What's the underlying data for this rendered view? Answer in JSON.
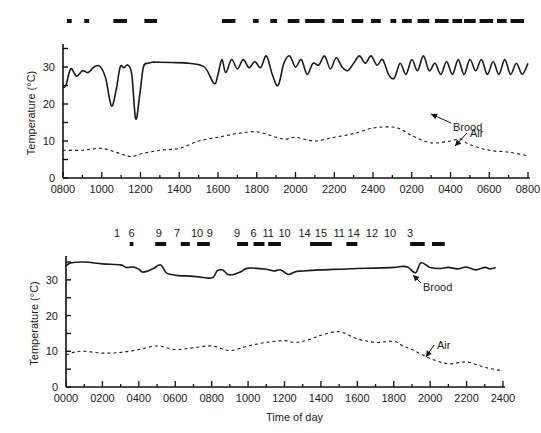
{
  "chart_data": [
    {
      "type": "line",
      "panel": "top",
      "title": "",
      "xlabel": "",
      "ylabel": "Temperature (°C)",
      "ylim": [
        0,
        36
      ],
      "yticks_labeled": [
        0,
        10,
        20,
        30
      ],
      "yticks_minor": [
        5,
        15,
        25,
        35
      ],
      "x_unit": "hours since 0800",
      "xlim": [
        0,
        24
      ],
      "xtick_labels": [
        "0800",
        "1000",
        "1200",
        "1400",
        "1600",
        "1800",
        "2000",
        "2200",
        "2400",
        "0200",
        "0400",
        "0600",
        "0800"
      ],
      "xtick_labels_at_hours": [
        0,
        2,
        4,
        6,
        8,
        10,
        12,
        14,
        16,
        18,
        20,
        22,
        24
      ],
      "grid": false,
      "legend": "none",
      "series": [
        {
          "name": "Brood",
          "style": "solid",
          "x": [
            0,
            0.15,
            0.4,
            0.7,
            1.0,
            1.3,
            1.6,
            1.9,
            2.2,
            2.5,
            2.75,
            2.95,
            3.15,
            3.35,
            3.55,
            3.75,
            3.95,
            4.15,
            4.4,
            4.6,
            4.8,
            5.0,
            5.6,
            6.5,
            7.3,
            7.8,
            8.0,
            8.2,
            8.4,
            8.7,
            9.0,
            9.3,
            9.6,
            9.9,
            10.2,
            10.5,
            10.8,
            11.1,
            11.4,
            11.7,
            12.0,
            12.3,
            12.6,
            12.9,
            13.2,
            13.5,
            13.8,
            14.1,
            14.4,
            14.7,
            15.0,
            15.3,
            15.6,
            15.9,
            16.2,
            16.5,
            16.8,
            17.1,
            17.4,
            17.7,
            18.0,
            18.3,
            18.6,
            18.9,
            19.2,
            19.5,
            19.8,
            20.1,
            20.4,
            20.7,
            21.0,
            21.3,
            21.6,
            21.9,
            22.2,
            22.5,
            22.8,
            23.1,
            23.4,
            23.7,
            24.0
          ],
          "values": [
            24.5,
            25,
            29.5,
            27.5,
            29,
            28.5,
            30,
            30.2,
            27,
            19.5,
            24,
            30,
            29.8,
            30.5,
            28,
            16,
            22,
            30,
            31,
            31.3,
            31.3,
            31.3,
            31.2,
            31,
            30,
            25.5,
            28,
            32,
            28.5,
            32,
            29.5,
            32,
            29.8,
            31.5,
            29.8,
            33,
            28,
            25,
            31,
            33,
            30,
            32,
            28,
            31,
            30.5,
            33,
            29.5,
            32.5,
            30,
            29,
            31,
            33,
            31,
            33,
            30.5,
            32,
            28,
            27,
            31,
            28,
            32,
            29,
            33,
            29,
            31,
            28,
            31.5,
            28,
            32,
            28,
            32,
            29,
            32,
            28,
            31.5,
            28,
            32,
            28,
            31,
            28,
            31
          ]
        },
        {
          "name": "Air",
          "style": "dashed",
          "x": [
            0,
            1,
            2,
            3,
            3.5,
            4,
            5,
            6,
            7,
            8,
            9,
            10,
            11,
            11.5,
            12,
            13,
            14,
            15,
            16,
            17,
            17.5,
            18,
            19,
            20,
            20.5,
            21,
            22,
            23,
            24
          ],
          "values": [
            7.5,
            7.5,
            8,
            6.5,
            5.8,
            6.5,
            7.5,
            8,
            10,
            11,
            12,
            12.5,
            11,
            10.5,
            11,
            10,
            11,
            12,
            13.5,
            13.8,
            13,
            11.5,
            9.5,
            10,
            10.5,
            9,
            7.5,
            7,
            6
          ]
        }
      ],
      "annotations": [
        {
          "text": "Brood",
          "target_series": "Brood",
          "arrow": true
        },
        {
          "text": "Air",
          "target_series": "Air",
          "arrow": true
        }
      ],
      "activity_bars": {
        "description": "black bars above plot marking activity periods",
        "periods_hours": [
          [
            0.2,
            0.45
          ],
          [
            1.1,
            1.35
          ],
          [
            2.6,
            3.3
          ],
          [
            4.2,
            4.85
          ],
          [
            8.2,
            8.9
          ],
          [
            9.8,
            10.1
          ],
          [
            10.7,
            11.05
          ],
          [
            11.6,
            12.2
          ],
          [
            12.5,
            13.5
          ],
          [
            13.9,
            14.5
          ],
          [
            14.9,
            15.5
          ],
          [
            15.9,
            16.4
          ],
          [
            16.9,
            17.2
          ],
          [
            17.5,
            18
          ],
          [
            18.3,
            18.9
          ],
          [
            19.2,
            19.9
          ],
          [
            20.1,
            20.6
          ],
          [
            20.7,
            21.3
          ],
          [
            21.5,
            22.2
          ],
          [
            22.4,
            22.9
          ],
          [
            23.1,
            23.8
          ]
        ]
      }
    },
    {
      "type": "line",
      "panel": "bottom",
      "title": "",
      "xlabel": "Time of day",
      "ylabel": "Temperature (°C)",
      "ylim": [
        0,
        36
      ],
      "yticks_labeled": [
        0,
        10,
        20,
        30
      ],
      "yticks_minor": [
        5,
        15,
        25,
        35
      ],
      "x_unit": "hours since 0000",
      "xlim": [
        0,
        24
      ],
      "xtick_labels": [
        "0000",
        "0200",
        "0400",
        "0600",
        "0800",
        "1000",
        "1200",
        "1400",
        "1600",
        "1800",
        "2000",
        "2200",
        "2400"
      ],
      "xtick_labels_at_hours": [
        0,
        2,
        4,
        6,
        8,
        10,
        12,
        14,
        16,
        18,
        20,
        22,
        24
      ],
      "grid": false,
      "legend": "none",
      "series": [
        {
          "name": "Brood",
          "style": "solid",
          "x": [
            0,
            0.3,
            1,
            2,
            3,
            3.3,
            3.7,
            4,
            4.2,
            4.5,
            4.8,
            5.2,
            5.5,
            5.8,
            6.2,
            7,
            7.8,
            8.1,
            8.3,
            8.6,
            8.9,
            9.2,
            9.6,
            10,
            11,
            11.4,
            11.8,
            12.2,
            12.6,
            13,
            14,
            15,
            16,
            17,
            18,
            18.5,
            18.8,
            19.2,
            19.5,
            20,
            20.5,
            21,
            21.5,
            22,
            22.5,
            23,
            23.3,
            23.6
          ],
          "values": [
            34,
            34.8,
            35,
            34.5,
            34.2,
            33.5,
            33.6,
            33,
            32.2,
            32.5,
            33.2,
            34.2,
            32,
            31.5,
            31.2,
            31,
            30.5,
            30.8,
            32.5,
            32.8,
            31.5,
            31.5,
            32.3,
            33.3,
            33,
            32.5,
            32.8,
            31.5,
            32.3,
            32.5,
            32.8,
            33,
            33.2,
            33.3,
            33.5,
            33.8,
            33.5,
            32,
            34.8,
            33.5,
            33.2,
            33.5,
            33.1,
            33.6,
            32.8,
            33.5,
            33.1,
            33.4
          ]
        },
        {
          "name": "Air",
          "style": "dashed",
          "x": [
            0,
            0.5,
            1,
            2,
            3,
            4,
            5,
            6,
            7,
            8,
            9,
            10,
            11,
            12,
            12.5,
            13,
            13.5,
            14,
            15,
            16,
            17,
            18,
            18.5,
            19,
            20,
            21,
            22,
            23,
            24
          ],
          "values": [
            9,
            9.8,
            10,
            9.5,
            9.7,
            10.5,
            11.5,
            10.5,
            11,
            11.5,
            10.2,
            11.5,
            12.5,
            13,
            12.5,
            12.8,
            13.5,
            14.5,
            15.5,
            13.5,
            12.5,
            12.8,
            11.5,
            10.5,
            8,
            6.5,
            7,
            5.5,
            4.5
          ]
        }
      ],
      "annotations": [
        {
          "text": "Brood",
          "target_series": "Brood",
          "arrow": true
        },
        {
          "text": "Air",
          "target_series": "Air",
          "arrow": true
        }
      ],
      "activity_bars": {
        "description": "black bars above plot with numeric count labels",
        "count_labels": [
          "1",
          "6",
          "9",
          "7",
          "10",
          "9",
          "9",
          "6",
          "11",
          "10",
          "14",
          "15",
          "11",
          "14",
          "12",
          "10",
          "3"
        ],
        "periods_hours": [
          [
            3.5,
            3.7
          ],
          [
            4.9,
            5.5
          ],
          [
            6.3,
            6.8
          ],
          [
            7.2,
            7.9
          ],
          [
            9.4,
            10
          ],
          [
            10.3,
            10.9
          ],
          [
            11.1,
            11.8
          ],
          [
            13.4,
            14.6
          ],
          [
            15.4,
            16
          ],
          [
            18.9,
            19.7
          ],
          [
            20.1,
            20.8
          ]
        ]
      }
    }
  ]
}
